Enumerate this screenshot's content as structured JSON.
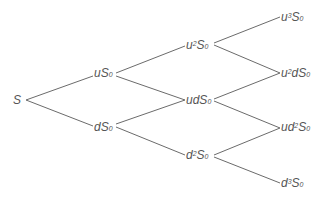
{
  "diagram": {
    "type": "binomial-tree",
    "line_color": "#6b6b6b",
    "nodes": [
      {
        "id": "S",
        "pre": "S",
        "sup": "",
        "mid": "",
        "base": "",
        "sub": "",
        "x": 13,
        "y": 94
      },
      {
        "id": "uS0",
        "pre": "u",
        "sup": "",
        "mid": "",
        "base": "S",
        "sub": "0",
        "x": 94,
        "y": 67
      },
      {
        "id": "dS0",
        "pre": "d",
        "sup": "",
        "mid": "",
        "base": "S",
        "sub": "0",
        "x": 94,
        "y": 121
      },
      {
        "id": "u2S0",
        "pre": "u",
        "sup": "2",
        "mid": "",
        "base": "S",
        "sub": "0",
        "x": 186,
        "y": 39
      },
      {
        "id": "udS0",
        "pre": "ud",
        "sup": "",
        "mid": "",
        "base": "S",
        "sub": "0",
        "x": 186,
        "y": 94
      },
      {
        "id": "d2S0",
        "pre": "d",
        "sup": "2",
        "mid": "",
        "base": "S",
        "sub": "0",
        "x": 186,
        "y": 149
      },
      {
        "id": "u3S0",
        "pre": "u",
        "sup": "3",
        "mid": "",
        "base": "S",
        "sub": "0",
        "x": 281,
        "y": 11
      },
      {
        "id": "u2dS0",
        "pre": "u",
        "sup": "2",
        "mid": "d",
        "base": "S",
        "sub": "0",
        "x": 281,
        "y": 67
      },
      {
        "id": "ud2S0",
        "pre": "ud",
        "sup": "2",
        "mid": "",
        "base": "S",
        "sub": "0",
        "x": 281,
        "y": 121
      },
      {
        "id": "d3S0",
        "pre": "d",
        "sup": "3",
        "mid": "",
        "base": "S",
        "sub": "0",
        "x": 281,
        "y": 177
      }
    ],
    "edges": [
      {
        "from": "S",
        "to": "uS0",
        "x1": 26,
        "y1": 100,
        "x2": 93,
        "y2": 76
      },
      {
        "from": "S",
        "to": "dS0",
        "x1": 26,
        "y1": 100,
        "x2": 93,
        "y2": 126
      },
      {
        "from": "uS0",
        "to": "u2S0",
        "x1": 116,
        "y1": 73,
        "x2": 185,
        "y2": 46
      },
      {
        "from": "uS0",
        "to": "udS0",
        "x1": 116,
        "y1": 76,
        "x2": 185,
        "y2": 100
      },
      {
        "from": "dS0",
        "to": "udS0",
        "x1": 116,
        "y1": 124,
        "x2": 185,
        "y2": 100
      },
      {
        "from": "dS0",
        "to": "d2S0",
        "x1": 116,
        "y1": 127,
        "x2": 185,
        "y2": 155
      },
      {
        "from": "u2S0",
        "to": "u3S0",
        "x1": 214,
        "y1": 43,
        "x2": 280,
        "y2": 17
      },
      {
        "from": "u2S0",
        "to": "u2dS0",
        "x1": 214,
        "y1": 45,
        "x2": 280,
        "y2": 73
      },
      {
        "from": "udS0",
        "to": "u2dS0",
        "x1": 214,
        "y1": 99,
        "x2": 280,
        "y2": 73
      },
      {
        "from": "udS0",
        "to": "ud2S0",
        "x1": 214,
        "y1": 101,
        "x2": 280,
        "y2": 128
      },
      {
        "from": "d2S0",
        "to": "ud2S0",
        "x1": 214,
        "y1": 155,
        "x2": 280,
        "y2": 128
      },
      {
        "from": "d2S0",
        "to": "d3S0",
        "x1": 214,
        "y1": 157,
        "x2": 280,
        "y2": 183
      }
    ]
  }
}
